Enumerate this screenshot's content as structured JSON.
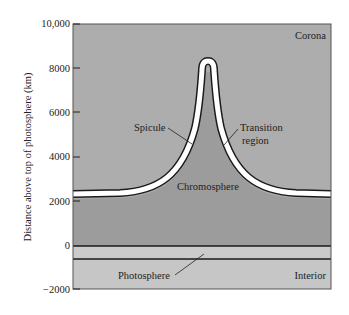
{
  "diagram": {
    "type": "cross-section",
    "y_axis": {
      "label": "Distance above top of photosphere (km)",
      "ticks": [
        "10,000",
        "8000",
        "6000",
        "4000",
        "2000",
        "0",
        "−2000"
      ],
      "tick_values": [
        10000,
        8000,
        6000,
        4000,
        2000,
        0,
        -2000
      ],
      "range": [
        -2000,
        10000
      ]
    },
    "regions": {
      "corona": "Corona",
      "chromosphere": "Chromosphere",
      "photosphere": "Photosphere",
      "interior": "Interior"
    },
    "annotations": {
      "spicule": "Spicule",
      "transition_line1": "Transition",
      "transition_line2": "region"
    },
    "colors": {
      "corona": "#adadad",
      "chromosphere": "#9c9c9c",
      "transition": "#ffffff",
      "photosphere": "#cbcbcb",
      "interior": "#c6c6c6",
      "outline": "#1a1a1a"
    },
    "levels_km": {
      "chromosphere_top_edges": 2400,
      "spicule_peak": 8200,
      "photosphere_top": 0,
      "photosphere_bottom": -600
    }
  }
}
